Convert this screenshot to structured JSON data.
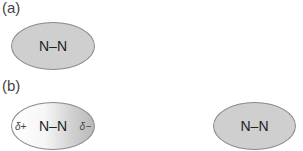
{
  "panel_a": {
    "label": "(a)",
    "molecule": "N–N"
  },
  "panel_b": {
    "label": "(b)",
    "polarized": {
      "molecule": "N–N",
      "delta_left": "δ+",
      "delta_right": "δ−"
    },
    "nonpolar": {
      "molecule": "N–N"
    }
  },
  "colors": {
    "fill": "#cfcfcf",
    "outline": "#8a8a8a"
  }
}
